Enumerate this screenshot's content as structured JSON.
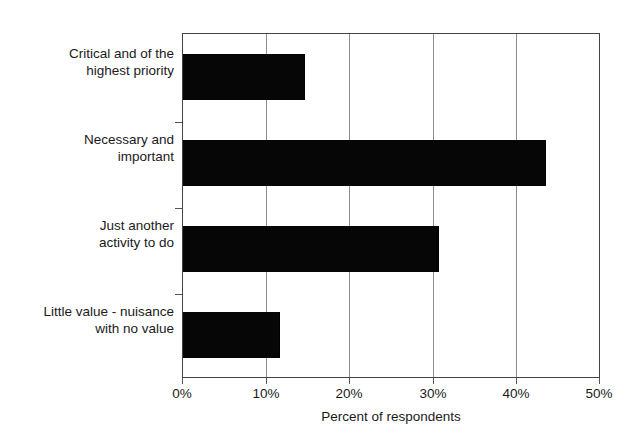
{
  "chart_data": {
    "type": "bar",
    "orientation": "horizontal",
    "title": "",
    "xlabel": "Percent of respondents",
    "ylabel": "",
    "categories": [
      "Critical and of the highest priority",
      "Necessary and important",
      "Just another activity to do",
      "Little value - nuisance with no value"
    ],
    "category_lines": [
      [
        "Critical and of the",
        "highest priority"
      ],
      [
        "Necessary and",
        "important"
      ],
      [
        "Just another",
        "activity to do"
      ],
      [
        "Little value - nuisance",
        "with no value"
      ]
    ],
    "values": [
      14.6,
      43.5,
      30.7,
      11.5
    ],
    "value_unit": "%",
    "xlim": [
      0,
      50
    ],
    "xticks": [
      0,
      10,
      20,
      30,
      40,
      50
    ],
    "xtick_labels": [
      "0%",
      "10%",
      "20%",
      "30%",
      "40%",
      "50%"
    ],
    "grid": "vertical",
    "legend": "none",
    "bar_color": "#060606",
    "grid_color": "#8c8c8c",
    "frame_color": "#444444"
  }
}
